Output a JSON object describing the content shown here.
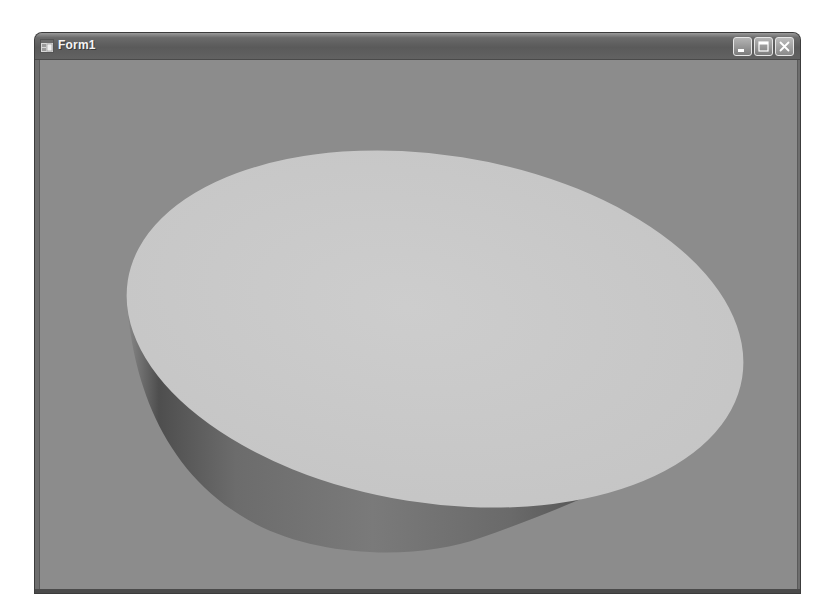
{
  "window": {
    "title": "Form1",
    "icon": "app-form-icon",
    "controls": {
      "minimize": {
        "icon": "minimize-icon"
      },
      "maximize": {
        "icon": "maximize-icon"
      },
      "close": {
        "icon": "close-icon"
      }
    }
  },
  "client": {
    "background_color": "#8c8c8c",
    "content": {
      "type": "3d-render",
      "object": "cylinder",
      "top_face_color": "#c9c9c9",
      "side_color_dark": "#5e5e5e",
      "side_color_light": "#8a8a8a"
    }
  }
}
